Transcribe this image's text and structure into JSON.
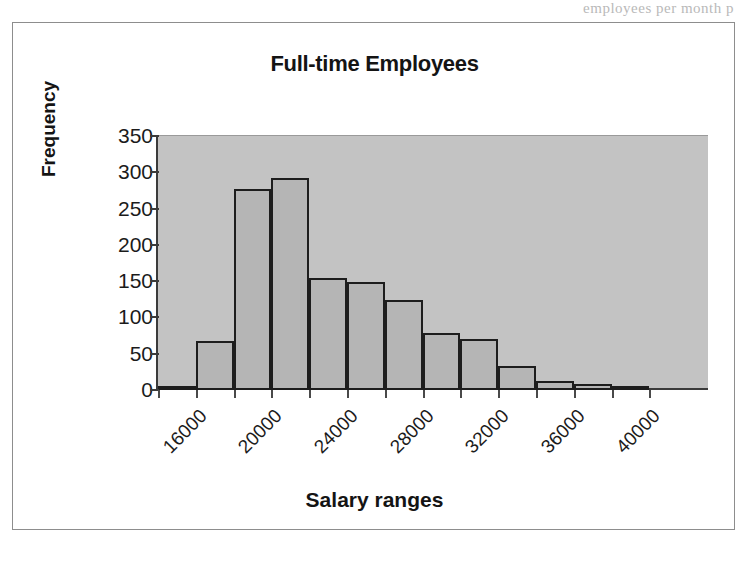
{
  "page": {
    "bleed_text": "employees per month p"
  },
  "figure": {
    "title": "Full-time Employees",
    "x_axis_title": "Salary ranges",
    "y_axis_title": "Frequency"
  },
  "chart_data": {
    "type": "bar",
    "title": "Full-time Employees",
    "xlabel": "Salary ranges",
    "ylabel": "Frequency",
    "ylim": [
      0,
      350
    ],
    "y_ticks": [
      0,
      50,
      100,
      150,
      200,
      250,
      300,
      350
    ],
    "y_tick_labels": [
      "0",
      "50",
      "100",
      "150",
      "200",
      "250",
      "300",
      "350"
    ],
    "grid": false,
    "legend": "none",
    "x_tick_labels": [
      "16000",
      "20000",
      "24000",
      "28000",
      "32000",
      "36000",
      "40000"
    ],
    "x_tick_label_rotation": -45,
    "bin_width": 2000,
    "bin_starts": [
      14000,
      16000,
      18000,
      20000,
      22000,
      24000,
      26000,
      28000,
      30000,
      32000,
      34000,
      36000,
      38000
    ],
    "categories": [
      "14000",
      "16000",
      "18000",
      "20000",
      "22000",
      "24000",
      "26000",
      "28000",
      "30000",
      "32000",
      "34000",
      "36000",
      "38000"
    ],
    "values": [
      3,
      68,
      277,
      292,
      155,
      149,
      124,
      79,
      70,
      33,
      13,
      8,
      6
    ],
    "bar_fill_color": "#b5b5b5",
    "bar_edge_color": "#1d1d1d",
    "plot_background_color": "#c3c3c3",
    "figure_background_color": "#ffffff"
  }
}
